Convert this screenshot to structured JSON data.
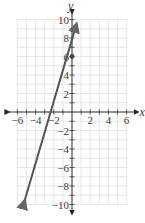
{
  "chart_data": {
    "type": "line",
    "title": "",
    "xlabel": "x",
    "ylabel": "y",
    "xlim": [
      -6,
      6
    ],
    "ylim": [
      -10,
      10
    ],
    "grid": true,
    "grid_step": 1,
    "x_ticks": [
      -6,
      -4,
      -2,
      2,
      4,
      6
    ],
    "y_ticks": [
      -10,
      -8,
      -6,
      -4,
      -2,
      2,
      4,
      6,
      8,
      10
    ],
    "x_tick_labels": [
      "−6",
      "−4",
      "−2",
      "2",
      "4",
      "6"
    ],
    "y_tick_labels": [
      "−10",
      "−8",
      "−6",
      "−4",
      "−2",
      "2",
      "4",
      "6",
      "8",
      "10"
    ],
    "series": [
      {
        "name": "line",
        "equation": "y = 3x + 6",
        "slope": 3,
        "intercept": 6,
        "x": [
          -5.3,
          0.4
        ],
        "y": [
          -9.9,
          9.2
        ],
        "arrows": "both",
        "color": "#555555"
      }
    ],
    "points": [
      {
        "x": 0,
        "y": 6,
        "label": "y-intercept"
      }
    ],
    "x_intercept": -2,
    "y_intercept": 6
  },
  "labels": {
    "x_axis": "x",
    "y_axis": "y"
  },
  "colors": {
    "grid": "#dcdcdc",
    "axis": "#333333",
    "line": "#555555",
    "background": "#ffffff"
  }
}
